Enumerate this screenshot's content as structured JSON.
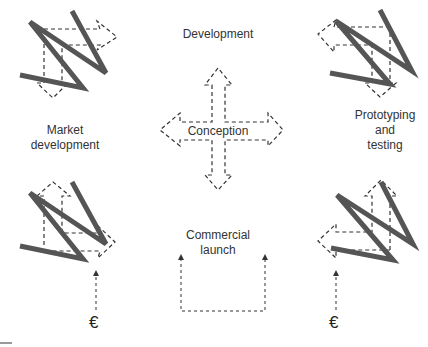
{
  "diagram": {
    "stages": {
      "top": "Development",
      "left": "Market development",
      "left_line1": "Market",
      "left_line2": "development",
      "right_line1": "Prototyping",
      "right_line2": "and",
      "right_line3": "testing",
      "center": "Conception",
      "bottom_line1": "Commercial",
      "bottom_line2": "launch"
    },
    "funding": {
      "left_symbol": "€",
      "right_symbol": "€"
    },
    "colors": {
      "zigzag": "#555555",
      "dashed": "#333333",
      "text": "#333333"
    }
  }
}
